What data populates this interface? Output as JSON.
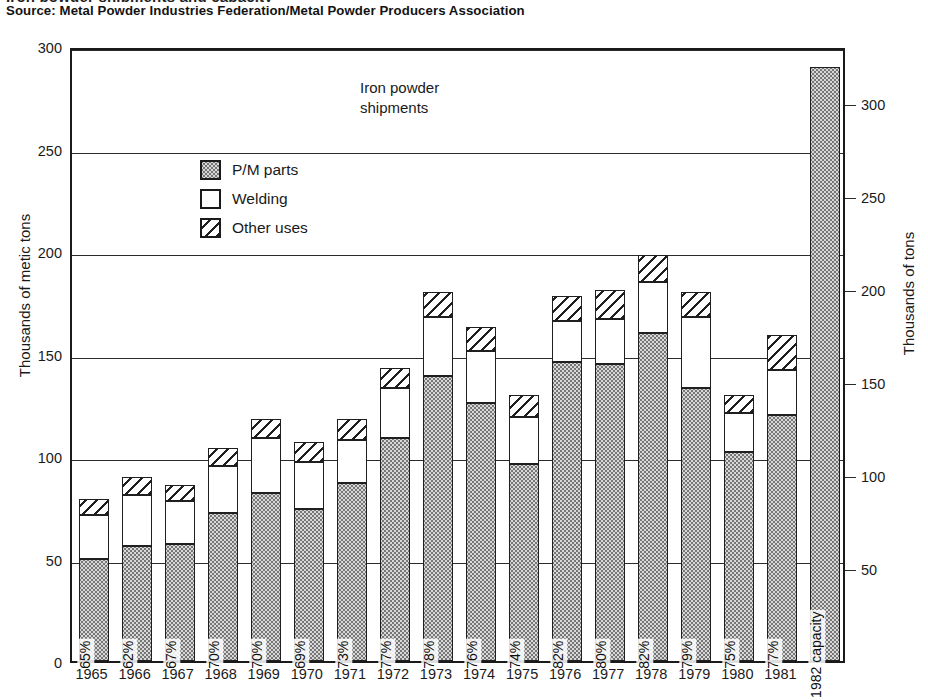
{
  "title_cropped": "Iron powder shipments and capacity",
  "source": "Source: Metal Powder Industries Federation/Metal Powder Producers Association",
  "annotation": {
    "line1": "Iron powder",
    "line2": "shipments"
  },
  "axes": {
    "left_label": "Thousands of metic tons",
    "right_label": "Thousands of tons",
    "left_ticks": [
      "300",
      "250",
      "200",
      "150",
      "100",
      "50",
      "0"
    ],
    "right_ticks": [
      "300",
      "250",
      "200",
      "150",
      "100",
      "50"
    ]
  },
  "legend": {
    "items": [
      {
        "label": "P/M parts",
        "pattern": "dotted"
      },
      {
        "label": "Welding",
        "pattern": "white"
      },
      {
        "label": "Other uses",
        "pattern": "hatched"
      }
    ]
  },
  "chart_data": {
    "type": "bar",
    "subtype": "stacked-vertical",
    "title": "Iron powder shipments",
    "xlabel": "",
    "ylabel": "Thousands of metic tons",
    "ylabel_secondary": "Thousands of tons",
    "ylim": [
      0,
      300
    ],
    "ylim_secondary": [
      0,
      330
    ],
    "yticks": [
      0,
      50,
      100,
      150,
      200,
      250,
      300
    ],
    "yticks_secondary": [
      50,
      100,
      150,
      200,
      250,
      300
    ],
    "grid": "horizontal",
    "legend_position": "inside-upper-left",
    "categories": [
      "1965",
      "1966",
      "1967",
      "1968",
      "1969",
      "1970",
      "1971",
      "1972",
      "1973",
      "1974",
      "1975",
      "1976",
      "1977",
      "1978",
      "1979",
      "1980",
      "1981",
      "1982 capacity"
    ],
    "series": [
      {
        "name": "P/M parts",
        "values": [
          50,
          56,
          57,
          72,
          82,
          74,
          87,
          109,
          139,
          126,
          96,
          146,
          145,
          160,
          133,
          102,
          120,
          290
        ]
      },
      {
        "name": "Welding",
        "values": [
          21,
          25,
          21,
          23,
          27,
          23,
          21,
          24,
          29,
          25,
          23,
          20,
          22,
          25,
          35,
          19,
          22,
          0
        ]
      },
      {
        "name": "Other uses",
        "values": [
          8,
          9,
          8,
          9,
          9,
          10,
          10,
          10,
          12,
          12,
          11,
          12,
          14,
          13,
          12,
          9,
          17,
          0
        ]
      }
    ],
    "totals": [
      79,
      90,
      86,
      104,
      118,
      107,
      118,
      143,
      180,
      163,
      130,
      178,
      181,
      198,
      180,
      130,
      159,
      290
    ],
    "bar_labels": [
      "65%",
      "62%",
      "67%",
      "70%",
      "70%",
      "69%",
      "73%",
      "77%",
      "78%",
      "76%",
      "74%",
      "82%",
      "80%",
      "82%",
      "79%",
      "75%",
      "77%",
      "1982 capacity"
    ],
    "bar_label_meaning": "P/M parts share of total shipments"
  },
  "colors": {
    "ink": "#1a1a1a",
    "background": "#ffffff",
    "pm_parts_fill": "#d8d8d8",
    "welding_fill": "#ffffff",
    "other_fill": "#ffffff"
  }
}
